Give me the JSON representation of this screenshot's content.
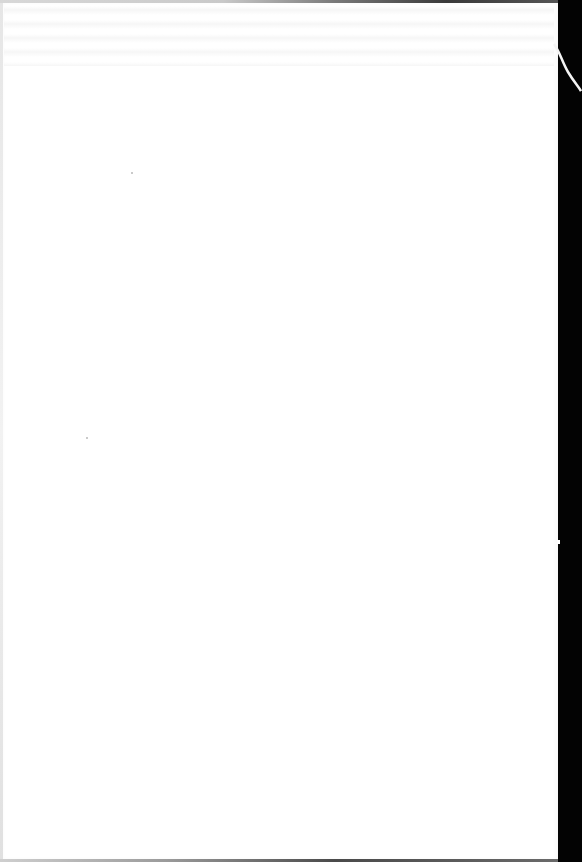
{
  "document": {
    "type": "scanned-page",
    "content_text": "",
    "page_state": "blank",
    "colors": {
      "paper": "#ffffff",
      "scanner_background": "#050505",
      "bleed_through": "#c8c8c8"
    }
  }
}
